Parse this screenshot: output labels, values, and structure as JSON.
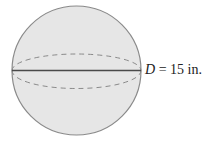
{
  "figure": {
    "shape": "sphere",
    "fill_color": "#e6e6e6",
    "outline_color": "#8a8a8a",
    "diameter_line_color": "#4a4a4a",
    "equator_style": "dashed"
  },
  "label": {
    "variable": "D",
    "equals": " = ",
    "value": "15 in."
  }
}
